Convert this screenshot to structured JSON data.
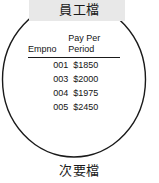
{
  "figure": {
    "title": "員工檔",
    "caption": "次要檔",
    "shape": "circle",
    "colors": {
      "outline": "#1a1a1a",
      "title_band": "#e8e8e8",
      "text": "#141414",
      "background": "#ffffff"
    }
  },
  "table": {
    "columns": [
      {
        "id": "empno",
        "header": "Empno",
        "header_line1": "",
        "header_line2": "Empno"
      },
      {
        "id": "pay_per_period",
        "header": "Pay Per Period",
        "header_line1": "Pay Per",
        "header_line2": "Period"
      }
    ],
    "rows": [
      {
        "empno": "001",
        "pay_per_period": "$1850"
      },
      {
        "empno": "003",
        "pay_per_period": "$2000"
      },
      {
        "empno": "004",
        "pay_per_period": "$1975"
      },
      {
        "empno": "005",
        "pay_per_period": "$2450"
      }
    ]
  }
}
